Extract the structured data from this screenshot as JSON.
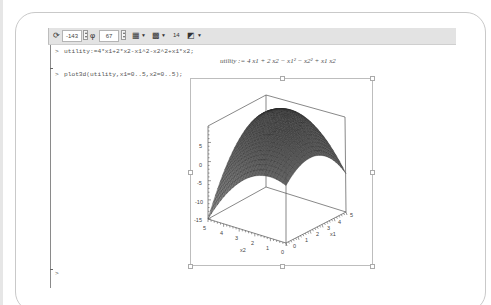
{
  "toolbar": {
    "rotate_icon": "rotate-3d-icon",
    "theta_value": "-143",
    "phi_icon": "phi-icon",
    "phi_value": "67",
    "style_menu_icon": "plot-style-icon",
    "color_menu_icon": "color-scheme-icon",
    "axes_label": "14",
    "projection_menu_icon": "projection-icon"
  },
  "worksheet": {
    "prompt": ">",
    "commands": [
      {
        "prompt": ">",
        "input": "utility:=4*x1+2*x2-x1^2-x2^2+x1*x2;"
      },
      {
        "prompt": ">",
        "input": "plot3d(utility,x1=0..5,x2=0..5);"
      }
    ],
    "output_math": "utility := 4 x1 + 2 x2 − x1² − x2² + x1 x2",
    "empty_prompt": ">"
  },
  "chart_data": {
    "type": "surface3d",
    "title": "",
    "function": "utility = 4*x1 + 2*x2 - x1^2 - x2^2 + x1*x2",
    "x_range": [
      0,
      5
    ],
    "y_range": [
      0,
      5
    ],
    "zlabel": "",
    "axes": {
      "x1": {
        "label": "x1",
        "ticks": [
          "0",
          "1",
          "2",
          "3",
          "4",
          "5"
        ]
      },
      "x2": {
        "label": "x2",
        "ticks": [
          "5",
          "4",
          "3",
          "2",
          "1",
          "0"
        ]
      },
      "z": {
        "ticks": [
          "5",
          "0",
          "-5",
          "-10",
          "-15"
        ],
        "range": [
          -15,
          9.3
        ]
      }
    },
    "orientation": {
      "theta": -143,
      "phi": 67
    },
    "style": "patch grid, grayscale shading, boxed axes",
    "sample_values": [
      {
        "x1": 0,
        "x2": 0,
        "utility": 0
      },
      {
        "x1": 5,
        "x2": 5,
        "utility": 5
      },
      {
        "x1": 0,
        "x2": 5,
        "utility": -15
      },
      {
        "x1": 5,
        "x2": 0,
        "utility": -5
      },
      {
        "x1": 3.33,
        "x2": 2.67,
        "utility": 9.33
      }
    ]
  }
}
